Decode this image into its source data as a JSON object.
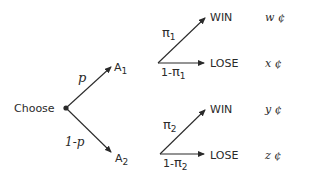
{
  "diagram": {
    "root": {
      "label": "Choose"
    },
    "branches": [
      {
        "prob_label": "p",
        "node": {
          "label": "A",
          "sub": "1"
        },
        "outcomes": [
          {
            "prob_label": "π",
            "prob_sub": "1",
            "prob_prefix": "",
            "label": "WIN",
            "value": "w ¢"
          },
          {
            "prob_label": "π",
            "prob_sub": "1",
            "prob_prefix": "1-",
            "label": "LOSE",
            "value": "x ¢"
          }
        ]
      },
      {
        "prob_label": "1-p",
        "node": {
          "label": "A",
          "sub": "2"
        },
        "outcomes": [
          {
            "prob_label": "π",
            "prob_sub": "2",
            "prob_prefix": "",
            "label": "WIN",
            "value": "y ¢"
          },
          {
            "prob_label": "π",
            "prob_sub": "2",
            "prob_prefix": "1-",
            "label": "LOSE",
            "value": "z ¢"
          }
        ]
      }
    ],
    "colors": {
      "ink": "#2a2a2a",
      "background": "#ffffff"
    }
  }
}
